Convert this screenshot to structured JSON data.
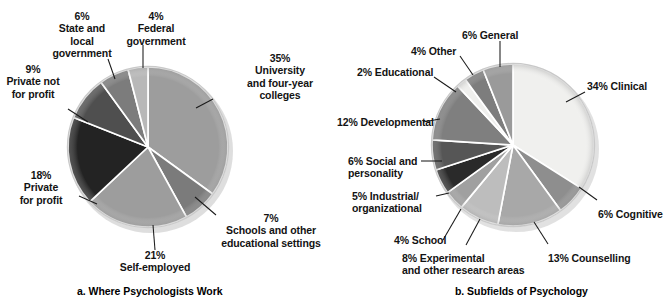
{
  "figure": {
    "background": "#ffffff",
    "text_color": "#131313"
  },
  "chart_data": [
    {
      "type": "pie",
      "id": "where-psychologists-work",
      "title": "a. Where Psychologists Work",
      "caption": "a. Where Psychologists Work",
      "legend": "labels-with-leader-lines",
      "grid": false,
      "start_angle_deg": 0,
      "direction": "clockwise",
      "center": [
        148,
        147
      ],
      "radius": 80,
      "categories": [
        "University and four-year colleges",
        "Schools and other educational settings",
        "Self-employed",
        "Private for profit",
        "Private not for profit",
        "State and local government",
        "Federal government"
      ],
      "values": [
        35,
        7,
        21,
        18,
        9,
        6,
        4
      ],
      "colors": [
        "#9d9d9d",
        "#7b7b7b",
        "#9d9d9d",
        "#232323",
        "#4f4f4f",
        "#7c7c7c",
        "#b8b8b8"
      ],
      "labels": [
        {
          "pct": "35%",
          "text": "35%\nUniversity\nand four-year\ncolleges"
        },
        {
          "pct": "7%",
          "text": "7%\nSchools and other\neducational settings"
        },
        {
          "pct": "21%",
          "text": "21%\nSelf-employed"
        },
        {
          "pct": "18%",
          "text": "18%\nPrivate\nfor profit"
        },
        {
          "pct": "9%",
          "text": "9%\nPrivate not\nfor profit"
        },
        {
          "pct": "6%",
          "text": "6%\nState and\nlocal\ngovernment"
        },
        {
          "pct": "4%",
          "text": "4%\nFederal\ngovernment"
        }
      ]
    },
    {
      "type": "pie",
      "id": "subfields-of-psychology",
      "title": "b. Subfields of Psychology",
      "caption": "b. Subfields of Psychology",
      "legend": "labels-with-leader-lines",
      "grid": false,
      "start_angle_deg": 0,
      "direction": "clockwise",
      "center": [
        513,
        145
      ],
      "radius": 81,
      "categories": [
        "Clinical",
        "Cognitive",
        "Counselling",
        "Experimental and other research areas",
        "School",
        "Industrial/organizational",
        "Social and personality",
        "Developmental",
        "Educational",
        "Other",
        "General"
      ],
      "values": [
        34,
        6,
        13,
        8,
        4,
        5,
        6,
        12,
        2,
        4,
        6
      ],
      "colors": [
        "#f0f0ee",
        "#8e8e8e",
        "#a8a8a8",
        "#bdbdbd",
        "#a0a0a0",
        "#2a2a2a",
        "#565656",
        "#7f7f7f",
        "#efefed",
        "#7d7d7d",
        "#9a9a9a"
      ],
      "labels": [
        {
          "pct": "34%",
          "text": "34% Clinical"
        },
        {
          "pct": "6%",
          "text": "6% Cognitive"
        },
        {
          "pct": "13%",
          "text": "13% Counselling"
        },
        {
          "pct": "8%",
          "text": "8% Experimental\nand other research areas"
        },
        {
          "pct": "4%",
          "text": "4% School"
        },
        {
          "pct": "5%",
          "text": "5% Industrial/\norganizational"
        },
        {
          "pct": "6%",
          "text": "6% Social and\npersonality"
        },
        {
          "pct": "12%",
          "text": "12% Developmental"
        },
        {
          "pct": "2%",
          "text": "2% Educational"
        },
        {
          "pct": "4%",
          "text": "4% Other"
        },
        {
          "pct": "6%",
          "text": "6% General"
        }
      ]
    }
  ],
  "left": {
    "caption": "a. Where Psychologists Work",
    "labels": {
      "university": "35%\nUniversity\nand four-year\ncolleges",
      "schools": "7%\nSchools and other\neducational settings",
      "self_employed": "21%\nSelf-employed",
      "private_for_profit": "18%\nPrivate\nfor profit",
      "private_not_for_profit": "9%\nPrivate not\nfor profit",
      "state_local": "6%\nState and\nlocal\ngovernment",
      "federal": "4%\nFederal\ngovernment"
    }
  },
  "right": {
    "caption": "b. Subfields of Psychology",
    "labels": {
      "clinical": "34% Clinical",
      "cognitive": "6% Cognitive",
      "counselling": "13% Counselling",
      "experimental": "8% Experimental\nand other research areas",
      "school": "4% School",
      "industrial": "5% Industrial/\norganizational",
      "social": "6% Social and\npersonality",
      "developmental": "12% Developmental",
      "educational": "2% Educational",
      "other": "4% Other",
      "general": "6% General"
    }
  }
}
